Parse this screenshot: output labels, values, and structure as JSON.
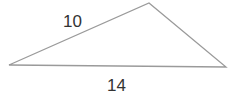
{
  "figure": {
    "type": "triangle",
    "vertices": {
      "left": [
        9,
        65
      ],
      "apex": [
        149,
        3
      ],
      "right": [
        226,
        67
      ]
    },
    "stroke_color": "#9a9a9a",
    "labels": {
      "left_side": "10",
      "base": "14"
    }
  }
}
